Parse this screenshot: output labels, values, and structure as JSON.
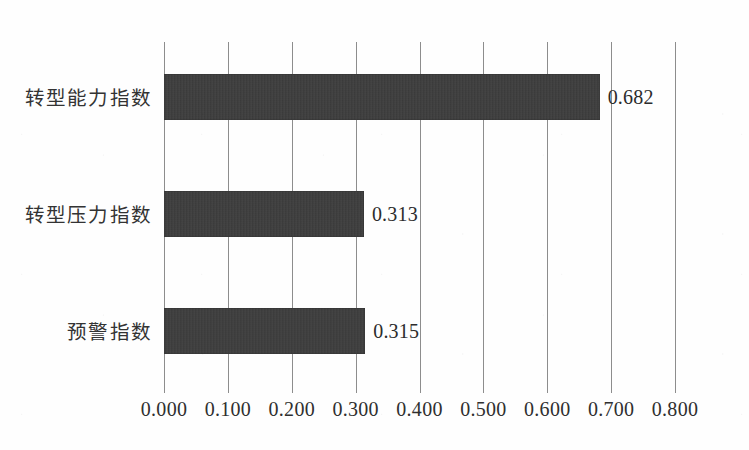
{
  "chart_data": {
    "type": "bar",
    "orientation": "horizontal",
    "title": "",
    "subtitle": "",
    "xlabel": "",
    "ylabel": "",
    "categories": [
      "转型能力指数",
      "转型压力指数",
      "预警指数"
    ],
    "values": [
      0.682,
      0.313,
      0.315
    ],
    "data_labels": [
      "0.682",
      "0.313",
      "0.315"
    ],
    "xlim": [
      0.0,
      0.8
    ],
    "xticks": [
      0.0,
      0.1,
      0.2,
      0.3,
      0.4,
      0.5,
      0.6,
      0.7,
      0.8
    ],
    "xtick_labels": [
      "0.000",
      "0.100",
      "0.200",
      "0.300",
      "0.400",
      "0.500",
      "0.600",
      "0.700",
      "0.800"
    ],
    "grid": "vertical",
    "legend": "none",
    "bar_color": "#3b3b3b",
    "gridline_color": "#8d8d8d",
    "background_color": "#ffffff",
    "series": [
      {
        "name": "指数值",
        "values": [
          0.682,
          0.313,
          0.315
        ]
      }
    ]
  }
}
